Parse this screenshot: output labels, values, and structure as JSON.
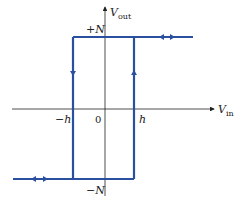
{
  "diagram": {
    "colors": {
      "curve": "#2a4f9e",
      "axes": "#222222"
    },
    "axes": {
      "y_label": {
        "main": "V",
        "sub": "out"
      },
      "x_label": {
        "main": "V",
        "sub": "in"
      }
    },
    "labels": {
      "plus_n": "+N",
      "minus_n": "−N",
      "minus_h": "−h",
      "zero": "0",
      "h": "h"
    }
  }
}
